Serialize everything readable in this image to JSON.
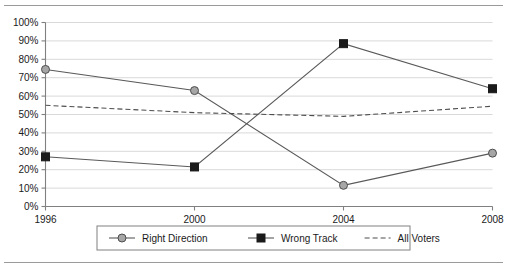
{
  "figure": {
    "top_rule": "horizontal-rule",
    "bottom_rule": "horizontal-rule"
  },
  "chart_data": {
    "type": "line",
    "title": "",
    "subtitle": "",
    "xlabel": "",
    "ylabel": "",
    "categories": [
      "1996",
      "2000",
      "2004",
      "2008"
    ],
    "x": [
      1996,
      2000,
      2004,
      2008
    ],
    "xlim": [
      1996,
      2008
    ],
    "ylim": [
      0,
      100
    ],
    "ytick_labels": [
      "0%",
      "10%",
      "20%",
      "30%",
      "40%",
      "50%",
      "60%",
      "70%",
      "80%",
      "90%",
      "100%"
    ],
    "ytick_values": [
      0,
      10,
      20,
      30,
      40,
      50,
      60,
      70,
      80,
      90,
      100
    ],
    "xtick_labels": [
      "1996",
      "2000",
      "2004",
      "2008"
    ],
    "grid": true,
    "grid_axis": "y",
    "grid_color": "#d9d9d9",
    "legend_position": "bottom",
    "series": [
      {
        "name": "Right Direction",
        "values": [
          74.5,
          63.0,
          11.5,
          29.0
        ],
        "marker": "circle",
        "marker_fill": "#a6a6a6",
        "line_color": "#595959",
        "line_style": "solid"
      },
      {
        "name": "Wrong Track",
        "values": [
          27.0,
          21.5,
          88.5,
          64.0
        ],
        "marker": "square",
        "marker_fill": "#1a1a1a",
        "line_color": "#595959",
        "line_style": "solid"
      },
      {
        "name": "All Voters",
        "values": [
          55.0,
          51.0,
          49.0,
          54.5
        ],
        "marker": "none",
        "marker_fill": "none",
        "line_color": "#4d4d4d",
        "line_style": "dashed"
      }
    ]
  },
  "legend": {
    "items": [
      {
        "label": "Right Direction",
        "marker": "circle-marker"
      },
      {
        "label": "Wrong Track",
        "marker": "square-marker"
      },
      {
        "label": "All Voters",
        "marker": "dashed-line-marker"
      }
    ]
  },
  "colors": {
    "axis": "#808080",
    "grid": "#d9d9d9",
    "line": "#595959",
    "dashed_line": "#4d4d4d",
    "circle_fill": "#a6a6a6",
    "square_fill": "#1a1a1a",
    "text": "#1a1a1a",
    "rule": "#9a9a9a",
    "legend_border": "#808080",
    "background": "#ffffff"
  }
}
